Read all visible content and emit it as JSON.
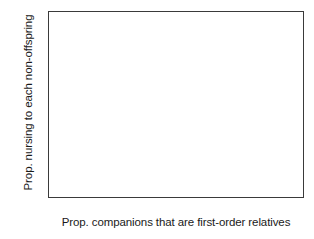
{
  "chart_data": {
    "type": "scatter",
    "title": "",
    "xlabel": "Prop. companions that are first-order relatives",
    "ylabel": "Prop. nursing to each non-offspring",
    "xlim": [
      0,
      1.04
    ],
    "ylim": [
      0,
      0.6
    ],
    "xticks": [
      0,
      0.2,
      0.4,
      0.6,
      0.8,
      1
    ],
    "yticks": [
      0,
      0.1,
      0.2,
      0.3,
      0.4,
      0.5,
      0.6
    ],
    "xticklabels": [
      "0",
      "0.2",
      "0.4",
      "0.6",
      "0.8",
      "1"
    ],
    "yticklabels": [
      "0",
      "0.1",
      "0.2",
      "0.3",
      "0.4",
      "0.5",
      "0.6"
    ],
    "grid": false,
    "legend": false,
    "minor_xticks": [
      0.1,
      0.3,
      0.5,
      0.7,
      0.9
    ],
    "minor_yticks": [
      0.05,
      0.15,
      0.25,
      0.35,
      0.45,
      0.55
    ],
    "series": [
      {
        "name": "observations",
        "marker": "filled-circle",
        "color": "#111111",
        "x": [
          0.0,
          0.0,
          0.0,
          0.042,
          0.13,
          0.167,
          0.167,
          0.28,
          0.5,
          0.5,
          0.5,
          1.0,
          1.0
        ],
        "y": [
          0.17,
          0.095,
          0.085,
          0.21,
          0.11,
          0.395,
          0.278,
          0.212,
          0.415,
          0.247,
          0.123,
          0.525,
          0.46
        ]
      }
    ],
    "fit_line": {
      "name": "regression-line",
      "color": "#111111",
      "x": [
        0.0,
        1.0
      ],
      "y": [
        0.148,
        0.475
      ]
    }
  },
  "axes": {
    "frame_color": "#3a3a3a"
  }
}
